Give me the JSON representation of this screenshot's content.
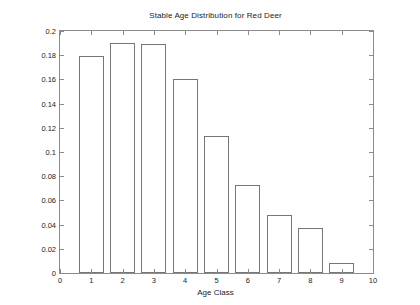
{
  "chart_data": {
    "type": "bar",
    "title": "Stable Age Distribution for Red Deer",
    "xlabel": "Age Class",
    "ylabel": "Fraction of Population",
    "categories": [
      "1",
      "2",
      "3",
      "4",
      "5",
      "6",
      "7",
      "8",
      "9"
    ],
    "values": [
      0.179,
      0.19,
      0.189,
      0.16,
      0.113,
      0.073,
      0.048,
      0.037,
      0.008
    ],
    "xlim": [
      0,
      10
    ],
    "ylim": [
      0,
      0.2
    ],
    "x_ticks": [
      "0",
      "1",
      "2",
      "3",
      "4",
      "5",
      "6",
      "7",
      "8",
      "9",
      "10"
    ],
    "x_tick_values": [
      0,
      1,
      2,
      3,
      4,
      5,
      6,
      7,
      8,
      9,
      10
    ],
    "y_ticks": [
      "0",
      "0.02",
      "0.04",
      "0.06",
      "0.08",
      "0.1",
      "0.12",
      "0.14",
      "0.16",
      "0.18",
      "0.2"
    ],
    "y_tick_values": [
      0,
      0.02,
      0.04,
      0.06,
      0.08,
      0.1,
      0.12,
      0.14,
      0.16,
      0.18,
      0.2
    ],
    "grid": false,
    "legend": null,
    "bar_width_fraction": 0.8,
    "colors": {
      "bar_fill": "#ffffff",
      "bar_edge": "#777777",
      "axis": "#8c8c8c",
      "text": "#222222",
      "background": "#ffffff"
    }
  }
}
